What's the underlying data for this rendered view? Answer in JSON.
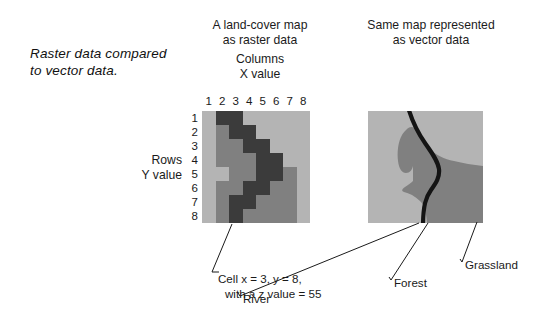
{
  "figure": {
    "caption": "Raster data compared to vector data."
  },
  "panels": {
    "raster": {
      "title_line1": "A land-cover map",
      "title_line2": "as raster data",
      "x_axis_line1": "Columns",
      "x_axis_line2": "X value",
      "y_axis_line1": "Rows",
      "y_axis_line2": "Y value",
      "column_labels": [
        "1",
        "2",
        "3",
        "4",
        "5",
        "6",
        "7",
        "8"
      ],
      "row_labels": [
        "1",
        "2",
        "3",
        "4",
        "5",
        "6",
        "7",
        "8"
      ],
      "callout_line1": "Cell x = 3, y = 8,",
      "callout_line2": "with a z value = 55"
    },
    "vector": {
      "title_line1": "Same map represented",
      "title_line2": "as vector data",
      "labels": {
        "river": "River",
        "forest": "Forest",
        "grassland": "Grassland"
      }
    }
  },
  "legend_colors": {
    "grassland": "#b4b4b4",
    "forest": "#808080",
    "river": "#3b3b3b",
    "line": "#141414",
    "text": "#1a1a1a"
  },
  "chart_data": {
    "type": "heatmap",
    "title": "A land-cover map as raster data",
    "xlabel": "Columns X value",
    "ylabel": "Rows Y value",
    "grid": true,
    "x": [
      1,
      2,
      3,
      4,
      5,
      6,
      7,
      8
    ],
    "y": [
      1,
      2,
      3,
      4,
      5,
      6,
      7,
      8
    ],
    "classes": [
      {
        "code": 0,
        "name": "Grassland",
        "color": "#b4b4b4"
      },
      {
        "code": 1,
        "name": "Forest",
        "color": "#808080"
      },
      {
        "code": 2,
        "name": "River",
        "color": "#3b3b3b"
      }
    ],
    "values": [
      [
        0,
        2,
        2,
        0,
        0,
        0,
        0,
        0
      ],
      [
        0,
        1,
        2,
        2,
        0,
        0,
        0,
        0
      ],
      [
        0,
        1,
        1,
        2,
        2,
        0,
        0,
        0
      ],
      [
        0,
        1,
        1,
        1,
        2,
        2,
        0,
        0
      ],
      [
        0,
        0,
        1,
        1,
        2,
        2,
        1,
        0
      ],
      [
        0,
        1,
        1,
        2,
        2,
        1,
        1,
        0
      ],
      [
        0,
        1,
        2,
        2,
        1,
        1,
        1,
        0
      ],
      [
        0,
        1,
        2,
        1,
        1,
        1,
        1,
        0
      ]
    ],
    "annotation": "Cell x = 3, y = 8, with a z value = 55"
  }
}
